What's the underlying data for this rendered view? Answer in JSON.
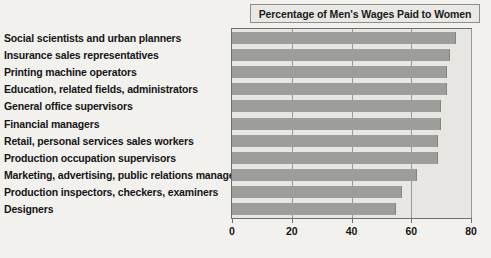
{
  "title": {
    "text": "Percentage of Men's Wages Paid to Women"
  },
  "axis": {
    "ticks": [
      "0",
      "20",
      "40",
      "60",
      "80"
    ]
  },
  "chart_data": {
    "type": "bar",
    "orientation": "horizontal",
    "title": "Percentage of Men's Wages Paid to Women",
    "xlabel": "",
    "ylabel": "",
    "xlim": [
      0,
      80
    ],
    "xticks": [
      0,
      20,
      40,
      60,
      80
    ],
    "grid": true,
    "legend": false,
    "categories": [
      "Social scientists and urban planners",
      "Insurance sales representatives",
      "Printing machine operators",
      "Education, related fields, administrators",
      "General office supervisors",
      "Financial managers",
      "Retail, personal services sales workers",
      "Production occupation supervisors",
      "Marketing, advertising, public relations managers",
      "Production inspectors, checkers, examiners",
      "Designers"
    ],
    "values": [
      75,
      73,
      72,
      72,
      70,
      70,
      69,
      69,
      62,
      57,
      55
    ],
    "bar_color": "#9d9d9a",
    "plot_background": "#e7e6e2",
    "figure_background": "#f2f1ee"
  }
}
